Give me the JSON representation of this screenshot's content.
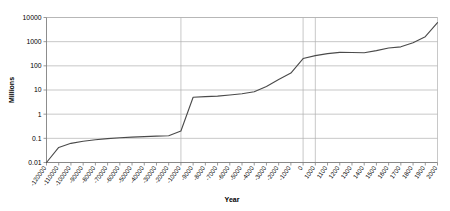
{
  "chart_data": {
    "type": "line",
    "title": "",
    "xlabel": "Year",
    "ylabel": "Millions",
    "yscale": "log",
    "ylim": [
      0.01,
      10000
    ],
    "ytick_labels": [
      "10000",
      "1000",
      "100",
      "10",
      "1",
      "0.1",
      "0.01"
    ],
    "ytick_values": [
      10000,
      1000,
      100,
      10,
      1,
      0.1,
      0.01
    ],
    "grid": true,
    "legend": "none",
    "xaxis_type": "categorical-nonuniform",
    "categories": [
      "-120000",
      "-110000",
      "-100000",
      "-90000",
      "-80000",
      "-70000",
      "-60000",
      "-50000",
      "-40000",
      "-30000",
      "-20000",
      "-10000",
      "-9000",
      "-8000",
      "-7000",
      "-6000",
      "-5000",
      "-4000",
      "-3000",
      "-2000",
      "-1000",
      "0",
      "1000",
      "1100",
      "1200",
      "1300",
      "1400",
      "1500",
      "1600",
      "1700",
      "1800",
      "1900",
      "2000"
    ],
    "values": [
      0.01,
      0.042,
      0.062,
      0.076,
      0.088,
      0.097,
      0.105,
      0.112,
      0.118,
      0.124,
      0.128,
      0.2,
      5.0,
      5.3,
      5.6,
      6.2,
      7.0,
      8.5,
      14.0,
      27.0,
      50.0,
      200.0,
      265.0,
      320.0,
      360.0,
      355.0,
      350.0,
      425.0,
      545.0,
      610.0,
      900.0,
      1600.0,
      6100.0
    ],
    "gridline_categories": [
      "-10000",
      "0",
      "1000"
    ],
    "series_color": "#4a4a4a",
    "grid_color": "#b0b0b0",
    "axis_color": "#808080"
  }
}
